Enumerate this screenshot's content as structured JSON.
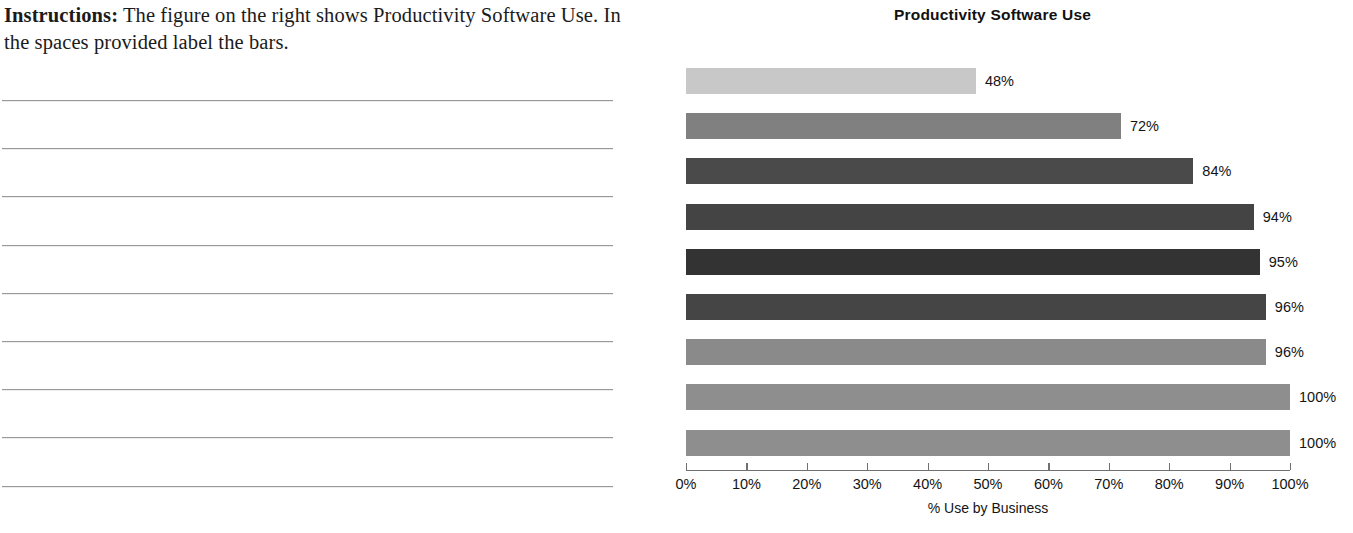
{
  "worksheet": {
    "instruction_lead": "Instructions:",
    "instruction_text": " The figure on the right shows Productivity Software Use.  In the spaces provided label the bars.",
    "answer_line_count": 9
  },
  "chart_data": {
    "type": "bar",
    "orientation": "horizontal",
    "title": "Productivity Software Use",
    "xlabel": "% Use by Business",
    "ylabel": "",
    "xlim": [
      0,
      100
    ],
    "grid": false,
    "legend": null,
    "categories": [
      "",
      "",
      "",
      "",
      "",
      "",
      "",
      "",
      ""
    ],
    "values": [
      48,
      72,
      84,
      94,
      95,
      96,
      96,
      100,
      100
    ],
    "data_labels": [
      "48%",
      "72%",
      "84%",
      "94%",
      "95%",
      "96%",
      "96%",
      "100%",
      "100%"
    ],
    "bar_colors": [
      "#c8c8c8",
      "#808080",
      "#4a4a4a",
      "#444444",
      "#333333",
      "#454545",
      "#8a8a8a",
      "#8e8e8e",
      "#8e8e8e"
    ],
    "tick_values": [
      0,
      10,
      20,
      30,
      40,
      50,
      60,
      70,
      80,
      90,
      100
    ],
    "tick_labels": [
      "0%",
      "10%",
      "20%",
      "30%",
      "40%",
      "50%",
      "60%",
      "70%",
      "80%",
      "90%",
      "100%"
    ]
  }
}
